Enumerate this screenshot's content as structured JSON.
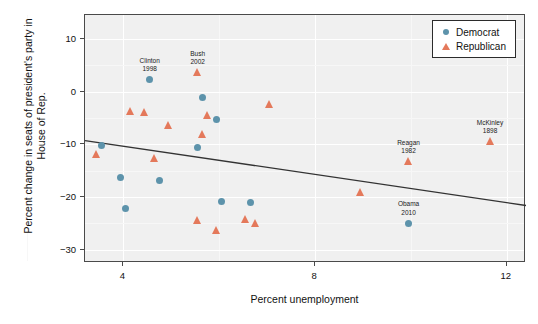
{
  "chart_data": {
    "type": "scatter",
    "title": "",
    "xlabel": "Percent unemployment",
    "ylabel": "Percent change in seats of president's party in House of Rep.",
    "xlim": [
      3.2,
      12.4
    ],
    "ylim": [
      -32.5,
      14.5
    ],
    "xticks": [
      "4",
      "8",
      "12"
    ],
    "xtick_values": [
      4,
      8,
      12
    ],
    "yticks": [
      "10",
      "0",
      "−10",
      "−20",
      "−30"
    ],
    "ytick_values": [
      10,
      0,
      -10,
      -20,
      -30
    ],
    "grid": true,
    "legend_position": "top-right",
    "legend": [
      {
        "label": "Democrat",
        "marker": "circle",
        "color": "#5d93ab"
      },
      {
        "label": "Republican",
        "marker": "triangle",
        "color": "#e4795b"
      }
    ],
    "series": [
      {
        "name": "Democrat",
        "marker": "circle",
        "color": "#5d93ab",
        "points": [
          {
            "x": 4.55,
            "y": 2.2,
            "label": "Clinton 1998"
          },
          {
            "x": 5.65,
            "y": -1.2,
            "label": ""
          },
          {
            "x": 5.95,
            "y": -5.3,
            "label": ""
          },
          {
            "x": 3.55,
            "y": -10.2,
            "label": ""
          },
          {
            "x": 5.55,
            "y": -10.6,
            "label": ""
          },
          {
            "x": 3.95,
            "y": -16.3,
            "label": ""
          },
          {
            "x": 4.75,
            "y": -16.8,
            "label": ""
          },
          {
            "x": 6.05,
            "y": -20.9,
            "label": ""
          },
          {
            "x": 6.65,
            "y": -21.0,
            "label": ""
          },
          {
            "x": 4.05,
            "y": -22.1,
            "label": ""
          },
          {
            "x": 9.95,
            "y": -25.0,
            "label": "Obama 2010"
          }
        ]
      },
      {
        "name": "Republican",
        "marker": "triangle",
        "color": "#e4795b",
        "points": [
          {
            "x": 5.55,
            "y": 3.5,
            "label": "Bush 2002"
          },
          {
            "x": 7.05,
            "y": -2.6,
            "label": ""
          },
          {
            "x": 4.15,
            "y": -3.8,
            "label": ""
          },
          {
            "x": 4.45,
            "y": -4.1,
            "label": ""
          },
          {
            "x": 5.75,
            "y": -4.6,
            "label": ""
          },
          {
            "x": 4.95,
            "y": -6.5,
            "label": ""
          },
          {
            "x": 5.65,
            "y": -8.2,
            "label": ""
          },
          {
            "x": 3.45,
            "y": -12.0,
            "label": ""
          },
          {
            "x": 4.65,
            "y": -12.8,
            "label": ""
          },
          {
            "x": 11.65,
            "y": -9.6,
            "label": "McKinley 1898"
          },
          {
            "x": 9.95,
            "y": -13.4,
            "label": "Reagan 1982"
          },
          {
            "x": 8.95,
            "y": -19.3,
            "label": ""
          },
          {
            "x": 5.55,
            "y": -24.6,
            "label": ""
          },
          {
            "x": 6.55,
            "y": -24.3,
            "label": ""
          },
          {
            "x": 5.95,
            "y": -26.4,
            "label": ""
          },
          {
            "x": 6.75,
            "y": -25.1,
            "label": ""
          }
        ]
      }
    ],
    "trendline": {
      "x_start": 3.2,
      "y_start": -9.3,
      "x_end": 12.4,
      "y_end": -21.6,
      "color": "#333333"
    },
    "annotations": [
      {
        "text_line1": "Clinton",
        "text_line2": "1998",
        "x": 4.55,
        "y": 2.2
      },
      {
        "text_line1": "Bush",
        "text_line2": "2002",
        "x": 5.55,
        "y": 3.5
      },
      {
        "text_line1": "McKinley",
        "text_line2": "1898",
        "x": 11.65,
        "y": -9.6
      },
      {
        "text_line1": "Reagan",
        "text_line2": "1982",
        "x": 9.95,
        "y": -13.4
      },
      {
        "text_line1": "Obama",
        "text_line2": "2010",
        "x": 9.95,
        "y": -25.0
      }
    ]
  }
}
